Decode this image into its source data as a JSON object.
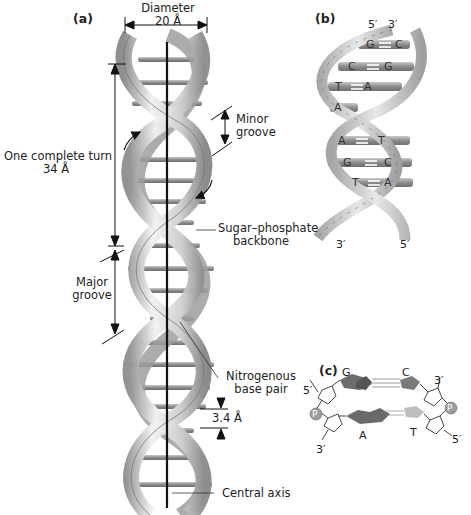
{
  "figure": {
    "panels": [
      {
        "id": "a",
        "label": "(a)"
      },
      {
        "id": "b",
        "label": "(b)"
      },
      {
        "id": "c",
        "label": "(c)"
      }
    ],
    "panel_a": {
      "diameter_label": "Diameter",
      "diameter_value": "20 Å",
      "turn_label": "One complete turn",
      "turn_value": "34 Å",
      "minor_groove": [
        "Minor",
        "groove"
      ],
      "major_groove": [
        "Major",
        "groove"
      ],
      "backbone": [
        "Sugar–phosphate",
        "backbone"
      ],
      "base_pair": [
        "Nitrogenous",
        "base pair"
      ],
      "rise_value": "3.4 Å",
      "axis_label": "Central axis"
    },
    "panel_b": {
      "top_left_end": "5′",
      "top_right_end": "3′",
      "bottom_left_end": "3′",
      "bottom_right_end": "5′",
      "base_pairs": [
        [
          "G",
          "C"
        ],
        [
          "C",
          "G"
        ],
        [
          "T",
          "A"
        ],
        [
          "A",
          ""
        ],
        [
          "A",
          "T"
        ],
        [
          "G",
          "C"
        ],
        [
          "T",
          "A"
        ]
      ],
      "backbone_letters": [
        "P",
        "S"
      ]
    },
    "panel_c": {
      "top_pair": [
        "G",
        "C"
      ],
      "bottom_pair": [
        "A",
        "T"
      ],
      "left_top_end": "5′",
      "left_bottom_end": "3′",
      "right_top_end": "3′",
      "right_bottom_end": "5′",
      "phosphate": "P"
    },
    "colors": {
      "ribbon_light": "#e9e9e9",
      "ribbon_mid": "#bdbdbd",
      "ribbon_dark": "#8a8a8a",
      "base_rung": "#9a9a9a",
      "axis": "#111111",
      "phosphate": "#9c9c9c"
    }
  }
}
